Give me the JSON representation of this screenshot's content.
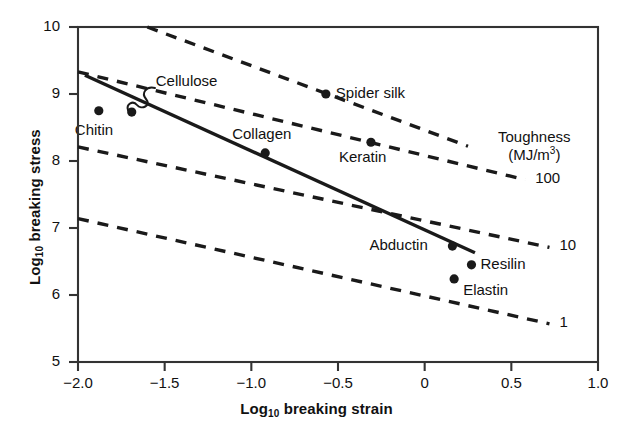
{
  "chart_data": {
    "type": "scatter",
    "title": "",
    "xlabel": "Log10 breaking strain",
    "ylabel": "Log10 breaking stress",
    "xlim": [
      -2.0,
      1.0
    ],
    "ylim": [
      5,
      10
    ],
    "grid": false,
    "legend_position": "none",
    "xticks": [
      "−2.0",
      "−1.5",
      "−1.0",
      "−0.5",
      "0",
      "0.5",
      "1.0"
    ],
    "xtick_values": [
      -2.0,
      -1.5,
      -1.0,
      -0.5,
      0,
      0.5,
      1.0
    ],
    "yticks": [
      "5",
      "6",
      "7",
      "8",
      "9",
      "10"
    ],
    "ytick_values": [
      5,
      6,
      7,
      8,
      9,
      10
    ],
    "points": [
      {
        "label": "Chitin",
        "x": -1.88,
        "y": 8.75
      },
      {
        "label": "Cellulose",
        "x": -1.69,
        "y": 8.73
      },
      {
        "label": "Collagen",
        "x": -0.92,
        "y": 8.12
      },
      {
        "label": "Spider silk",
        "x": -0.57,
        "y": 9.0
      },
      {
        "label": "Keratin",
        "x": -0.31,
        "y": 8.28
      },
      {
        "label": "Abductin",
        "x": 0.16,
        "y": 6.73
      },
      {
        "label": "Resilin",
        "x": 0.27,
        "y": 6.45
      },
      {
        "label": "Elastin",
        "x": 0.17,
        "y": 6.24
      }
    ],
    "trend_line": {
      "name": "best-fit line",
      "style": "solid",
      "x_start": -1.96,
      "y_start": 9.28,
      "x_end": 0.29,
      "y_end": 6.63
    },
    "iso_lines": [
      {
        "toughness": "",
        "style": "dashed",
        "x_start": -1.6,
        "y_start": 10.0,
        "x_end": 0.25,
        "y_end": 8.22
      },
      {
        "toughness": "100",
        "style": "dashed",
        "x_start": -2.0,
        "y_start": 9.33,
        "x_end": 0.58,
        "y_end": 7.72
      },
      {
        "toughness": "10",
        "style": "dashed",
        "x_start": -2.0,
        "y_start": 8.21,
        "x_end": 0.72,
        "y_end": 6.71
      },
      {
        "toughness": "1",
        "style": "dashed",
        "x_start": -2.0,
        "y_start": 7.14,
        "x_end": 0.72,
        "y_end": 5.57
      }
    ],
    "annotations": {
      "toughness_caption_line1": "Toughness",
      "toughness_caption_line2_prefix": "(MJ/m",
      "toughness_caption_line2_sup": "3",
      "toughness_caption_line2_suffix": ")",
      "iso_labels": [
        "100",
        "10",
        "1"
      ]
    },
    "leader_lines": [
      {
        "from_label": "Cellulose",
        "to_point": "Cellulose",
        "style": "curved"
      }
    ]
  },
  "axes": {
    "y_title_prefix": "Log",
    "y_title_sub": "10",
    "y_title_suffix": " breaking stress",
    "x_title_prefix": "Log",
    "x_title_sub": "10",
    "x_title_suffix": " breaking strain"
  },
  "colors": {
    "ink": "#1a1a1a",
    "background": "#ffffff",
    "axis": "#333333"
  }
}
